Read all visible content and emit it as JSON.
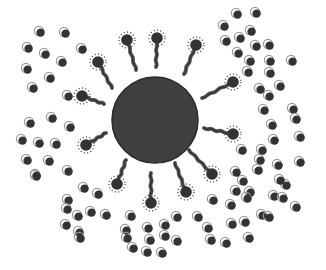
{
  "diagram": {
    "title": "",
    "colors": {
      "background": "#ffffff",
      "core": "#3f3f3f",
      "core_edge": "#2a2a2a",
      "tail": "#3a3a3a",
      "tail_outline": "#6a6a6a",
      "head": "#333333",
      "halo_dots": "#555555",
      "particle": "#333333",
      "particle_arc": "#9a9a9a"
    },
    "core": {
      "cx": 155,
      "cy": 120,
      "r": 43
    },
    "surfactants": [
      {
        "hx": 98,
        "hy": 62,
        "tx": 112,
        "ty": 88
      },
      {
        "hx": 127,
        "hy": 40,
        "tx": 136,
        "ty": 70
      },
      {
        "hx": 157,
        "hy": 38,
        "tx": 156,
        "ty": 67
      },
      {
        "hx": 196,
        "hy": 45,
        "tx": 184,
        "ty": 74
      },
      {
        "hx": 233,
        "hy": 82,
        "tx": 202,
        "ty": 98
      },
      {
        "hx": 233,
        "hy": 134,
        "tx": 204,
        "ty": 128
      },
      {
        "hx": 212,
        "hy": 174,
        "tx": 189,
        "ty": 150
      },
      {
        "hx": 186,
        "hy": 192,
        "tx": 175,
        "ty": 163
      },
      {
        "hx": 151,
        "hy": 203,
        "tx": 151,
        "ty": 173
      },
      {
        "hx": 117,
        "hy": 184,
        "tx": 126,
        "ty": 160
      },
      {
        "hx": 86,
        "hy": 145,
        "tx": 106,
        "ty": 133
      },
      {
        "hx": 82,
        "hy": 96,
        "tx": 104,
        "ty": 104
      }
    ],
    "particles": [
      [
        40,
        32
      ],
      [
        65,
        33
      ],
      [
        28,
        48
      ],
      [
        45,
        54
      ],
      [
        82,
        49
      ],
      [
        62,
        62
      ],
      [
        27,
        69
      ],
      [
        50,
        78
      ],
      [
        33,
        88
      ],
      [
        68,
        96
      ],
      [
        30,
        123
      ],
      [
        52,
        118
      ],
      [
        70,
        127
      ],
      [
        22,
        140
      ],
      [
        39,
        143
      ],
      [
        56,
        144
      ],
      [
        27,
        160
      ],
      [
        49,
        161
      ],
      [
        36,
        176
      ],
      [
        68,
        171
      ],
      [
        36,
        175
      ],
      [
        68,
        200
      ],
      [
        84,
        188
      ],
      [
        98,
        194
      ],
      [
        67,
        209
      ],
      [
        78,
        216
      ],
      [
        91,
        212
      ],
      [
        66,
        225
      ],
      [
        79,
        232
      ],
      [
        80,
        238
      ],
      [
        106,
        215
      ],
      [
        131,
        216
      ],
      [
        126,
        230
      ],
      [
        148,
        228
      ],
      [
        133,
        248
      ],
      [
        127,
        238
      ],
      [
        150,
        240
      ],
      [
        147,
        252
      ],
      [
        165,
        236
      ],
      [
        162,
        253
      ],
      [
        177,
        241
      ],
      [
        165,
        225
      ],
      [
        177,
        217
      ],
      [
        198,
        217
      ],
      [
        213,
        200
      ],
      [
        208,
        228
      ],
      [
        231,
        205
      ],
      [
        232,
        224
      ],
      [
        226,
        243
      ],
      [
        245,
        222
      ],
      [
        249,
        238
      ],
      [
        211,
        240
      ],
      [
        237,
        14
      ],
      [
        256,
        13
      ],
      [
        224,
        26
      ],
      [
        251,
        31
      ],
      [
        226,
        41
      ],
      [
        240,
        38
      ],
      [
        256,
        46
      ],
      [
        238,
        53
      ],
      [
        250,
        61
      ],
      [
        269,
        45
      ],
      [
        270,
        61
      ],
      [
        292,
        61
      ],
      [
        270,
        73
      ],
      [
        248,
        72
      ],
      [
        269,
        96
      ],
      [
        293,
        109
      ],
      [
        260,
        89
      ],
      [
        280,
        86
      ],
      [
        264,
        110
      ],
      [
        272,
        125
      ],
      [
        296,
        119
      ],
      [
        274,
        140
      ],
      [
        278,
        165
      ],
      [
        300,
        137
      ],
      [
        300,
        162
      ],
      [
        260,
        160
      ],
      [
        258,
        170
      ],
      [
        250,
        192
      ],
      [
        236,
        191
      ],
      [
        243,
        181
      ],
      [
        247,
        198
      ],
      [
        274,
        196
      ],
      [
        286,
        185
      ],
      [
        283,
        198
      ],
      [
        296,
        207
      ],
      [
        262,
        215
      ],
      [
        269,
        217
      ],
      [
        280,
        180
      ],
      [
        262,
        150
      ],
      [
        242,
        150
      ],
      [
        236,
        172
      ]
    ]
  }
}
